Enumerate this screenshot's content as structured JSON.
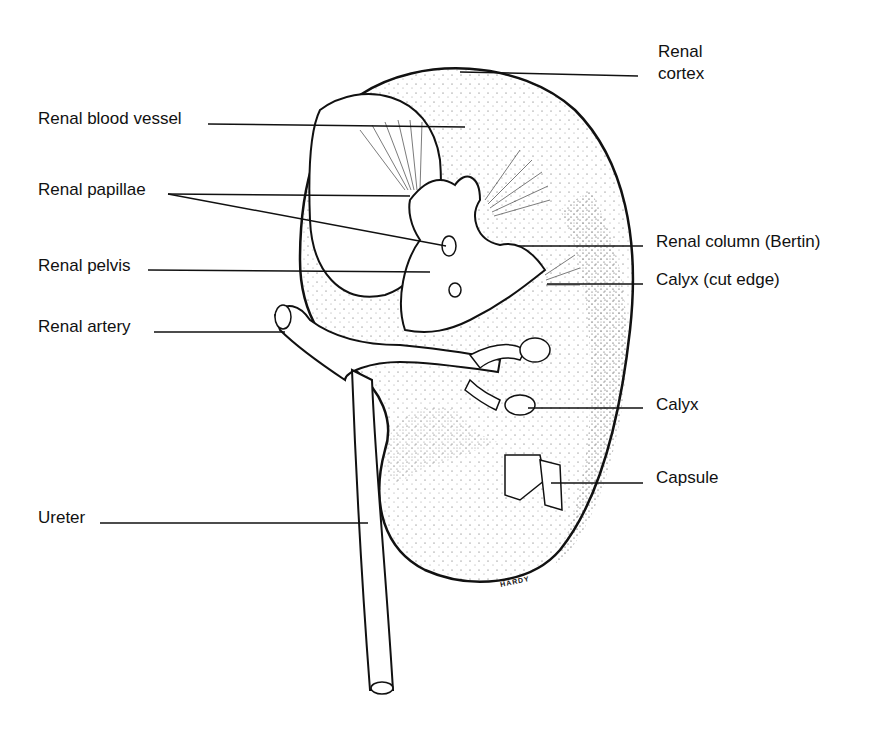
{
  "diagram": {
    "labels": {
      "renal_cortex_line1": "Renal",
      "renal_cortex_line2": "cortex",
      "renal_blood_vessel": "Renal blood vessel",
      "renal_papillae": "Renal papillae",
      "renal_pelvis": "Renal pelvis",
      "renal_artery": "Renal artery",
      "ureter": "Ureter",
      "renal_column": "Renal column (Bertin)",
      "calyx_cut_edge": "Calyx (cut edge)",
      "calyx": "Calyx",
      "capsule": "Capsule"
    },
    "signature": "HARDY",
    "colors": {
      "ink": "#111111",
      "background": "#ffffff"
    }
  }
}
